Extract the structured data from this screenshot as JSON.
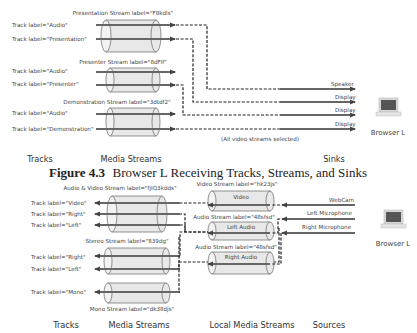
{
  "figure_top": {
    "streams": [
      {
        "label": "Presentation Stream label=\"F8kdls\"",
        "tracks": [
          "Track label=\"Audio\"",
          "Track label=\"Presentation\""
        ]
      },
      {
        "label": "Presenter Stream label=\"8dFlf\"",
        "tracks": [
          "Track label=\"Audio\"",
          "Track label=\"Presenter\""
        ]
      },
      {
        "label": "Demonstration Stream label=\"3dtdf2\"",
        "tracks": [
          "Track label=\"Audio\"",
          "Track label=\"Demonstration\""
        ]
      }
    ],
    "sinks": [
      "Speaker",
      "Display",
      "Display",
      "Display"
    ],
    "note": "(All video streams selected)",
    "device": "Browser L",
    "columns": [
      "Tracks",
      "Media Streams",
      "Sinks"
    ]
  },
  "caption": {
    "number": "Figure 4.3",
    "title": "Browser L Receiving Tracks, Streams, and Sinks"
  },
  "figure_bottom": {
    "remote_streams": [
      {
        "label": "Audio & Video Stream label=\"fjIQ3kdds\"",
        "tracks": [
          "Track label=\"Video\"",
          "Track label=\"Right\"",
          "Track label=\"Left\""
        ]
      },
      {
        "label": "Stereo Stream label=\"839dg\"",
        "tracks": [
          "Track label=\"Right\"",
          "Track label=\"Left\""
        ]
      },
      {
        "label": "Mono Stream label=\"dk38djs\"",
        "tracks": [
          "Track label=\"Mono\""
        ]
      }
    ],
    "local_streams": [
      {
        "label": "Video Stream label=\"hk23js\"",
        "inner": "Video"
      },
      {
        "label": "Audio Stream label=\"48sfsd\"",
        "inner": "Left Audio"
      },
      {
        "label": "Audio Stream label=\"48sfsd\"",
        "inner": "Right Audio"
      }
    ],
    "sources": [
      "WebCam",
      "Left Microphone",
      "Right Microphone"
    ],
    "device": "Browser L",
    "columns": [
      "Tracks",
      "Media Streams",
      "Local Media Streams",
      "Sources"
    ]
  }
}
